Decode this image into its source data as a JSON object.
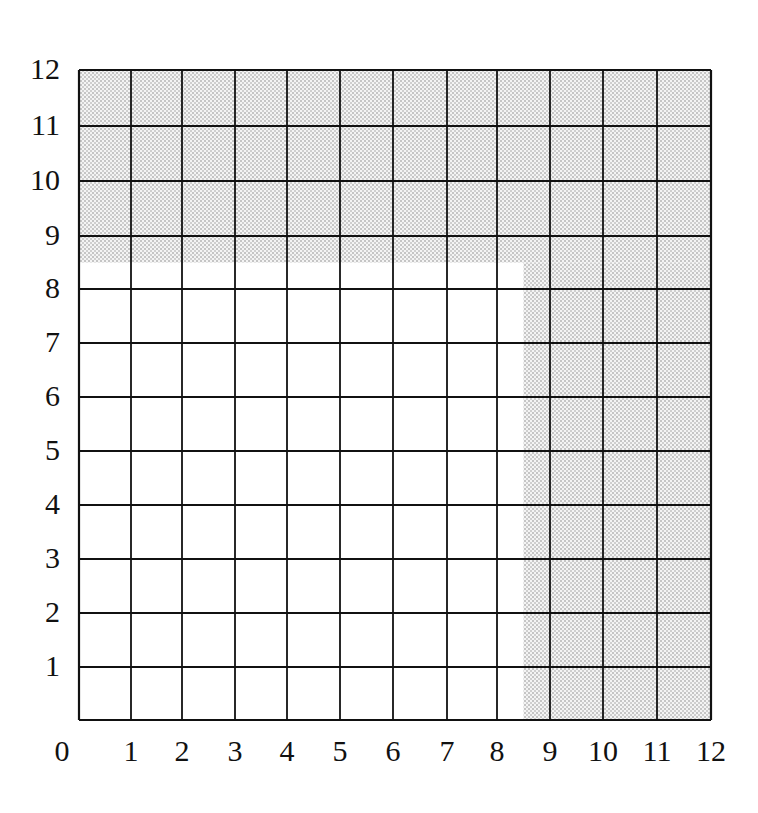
{
  "diagram": {
    "type": "grid",
    "title": "",
    "columns": 12,
    "rows": 12,
    "x_labels": [
      "0",
      "1",
      "2",
      "3",
      "4",
      "5",
      "6",
      "7",
      "8",
      "9",
      "10",
      "11",
      "12"
    ],
    "y_labels": [
      "1",
      "2",
      "3",
      "4",
      "5",
      "6",
      "7",
      "8",
      "9",
      "10",
      "11",
      "12"
    ],
    "shaded_regions": [
      {
        "name": "top-band",
        "x_from": 0,
        "x_to": 12,
        "y_from": 8.5,
        "y_to": 12
      },
      {
        "name": "right-band",
        "x_from": 8.5,
        "x_to": 12,
        "y_from": 0,
        "y_to": 8.5
      }
    ],
    "colors": {
      "grid_line": "#111111",
      "shade_dot": "#8a8a8a",
      "background": "#ffffff"
    }
  }
}
